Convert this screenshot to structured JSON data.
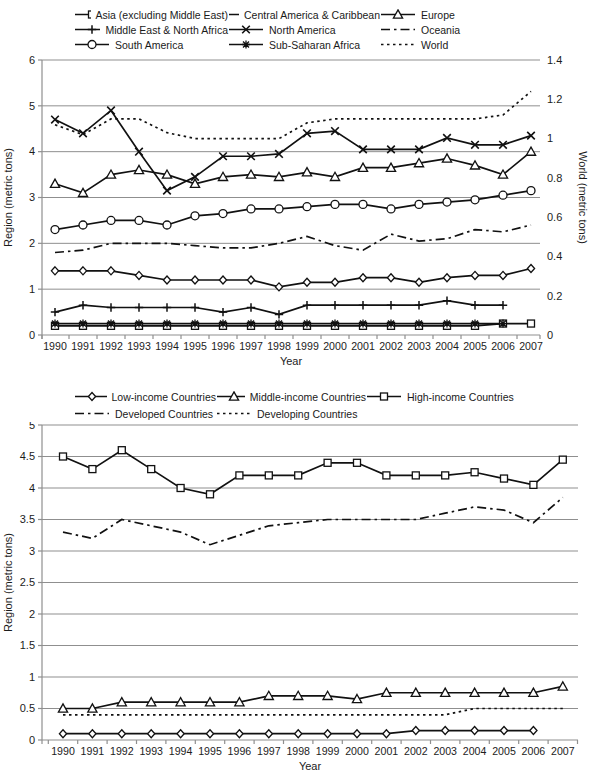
{
  "colors": {
    "ink": "#111111",
    "grid": "#8f8f8f",
    "background": "#ffffff"
  },
  "chart_data": [
    {
      "type": "line",
      "title": "",
      "xlabel": "Year",
      "ylabel": "Region (metric tons)",
      "y2label": "World (metric tons)",
      "x": [
        "1990",
        "1991",
        "1992",
        "1993",
        "1994",
        "1995",
        "1996",
        "1997",
        "1998",
        "1999",
        "2000",
        "2001",
        "2002",
        "2003",
        "2004",
        "2005",
        "2006",
        "2007"
      ],
      "ylim": [
        0,
        6
      ],
      "yticks": [
        "0",
        "1",
        "2",
        "3",
        "4",
        "5",
        "6"
      ],
      "y2lim": [
        0,
        1.4
      ],
      "y2ticks": [
        "0",
        "0.2",
        "0.4",
        "0.6",
        "0.8",
        "1",
        "1.2",
        "1.4"
      ],
      "grid": true,
      "legend_position": "top",
      "series": [
        {
          "name": "Asia (excluding Middle East)",
          "marker": "square",
          "dash": "solid",
          "axis": "left",
          "values": [
            0.2,
            0.2,
            0.2,
            0.2,
            0.2,
            0.2,
            0.2,
            0.2,
            0.2,
            0.2,
            0.2,
            0.2,
            0.2,
            0.2,
            0.2,
            0.2,
            0.25,
            0.25
          ]
        },
        {
          "name": "Central America & Caribbean",
          "marker": "diamond",
          "dash": "solid",
          "axis": "left",
          "values": [
            1.4,
            1.4,
            1.4,
            1.3,
            1.2,
            1.2,
            1.2,
            1.2,
            1.05,
            1.15,
            1.15,
            1.25,
            1.25,
            1.15,
            1.25,
            1.3,
            1.3,
            1.45
          ]
        },
        {
          "name": "Europe",
          "marker": "triangle",
          "dash": "solid",
          "axis": "left",
          "values": [
            3.3,
            3.1,
            3.5,
            3.6,
            3.5,
            3.3,
            3.45,
            3.5,
            3.45,
            3.55,
            3.45,
            3.65,
            3.65,
            3.75,
            3.85,
            3.7,
            3.5,
            4.0
          ]
        },
        {
          "name": "Middle East & North Africa",
          "marker": "plus",
          "dash": "solid",
          "axis": "left",
          "values": [
            0.5,
            0.65,
            0.6,
            0.6,
            0.6,
            0.6,
            0.5,
            0.6,
            0.45,
            0.65,
            0.65,
            0.65,
            0.65,
            0.65,
            0.75,
            0.65,
            0.65,
            null
          ]
        },
        {
          "name": "North America",
          "marker": "x",
          "dash": "solid",
          "axis": "left",
          "values": [
            4.7,
            4.4,
            4.9,
            4.0,
            3.15,
            3.45,
            3.9,
            3.9,
            3.95,
            4.4,
            4.45,
            4.05,
            4.05,
            4.05,
            4.3,
            4.15,
            4.15,
            4.35
          ]
        },
        {
          "name": "Oceania",
          "marker": "none",
          "dash": "dashdot",
          "axis": "left",
          "values": [
            1.8,
            1.85,
            2.0,
            2.0,
            2.0,
            1.95,
            1.9,
            1.9,
            2.0,
            2.15,
            1.95,
            1.85,
            2.2,
            2.05,
            2.1,
            2.3,
            2.25,
            2.4
          ]
        },
        {
          "name": "South America",
          "marker": "circle",
          "dash": "solid",
          "axis": "left",
          "values": [
            2.3,
            2.4,
            2.5,
            2.5,
            2.4,
            2.6,
            2.65,
            2.75,
            2.75,
            2.8,
            2.85,
            2.85,
            2.75,
            2.85,
            2.9,
            2.95,
            3.05,
            3.15
          ]
        },
        {
          "name": "Sub-Saharan Africa",
          "marker": "star",
          "dash": "solid",
          "axis": "left",
          "values": [
            0.25,
            0.25,
            0.25,
            0.25,
            0.25,
            0.25,
            0.25,
            0.25,
            0.25,
            0.25,
            0.25,
            0.25,
            0.25,
            0.25,
            0.25,
            0.25,
            0.25,
            null
          ]
        },
        {
          "name": "World",
          "marker": "none",
          "dash": "dotted",
          "axis": "right",
          "values": [
            1.07,
            1.02,
            1.1,
            1.1,
            1.03,
            1.0,
            1.0,
            1.0,
            1.0,
            1.08,
            1.1,
            1.1,
            1.1,
            1.1,
            1.1,
            1.1,
            1.12,
            1.24
          ]
        }
      ]
    },
    {
      "type": "line",
      "title": "",
      "xlabel": "Year",
      "ylabel": "Region (metric tons)",
      "x": [
        "1990",
        "1991",
        "1992",
        "1993",
        "1994",
        "1995",
        "1996",
        "1997",
        "1998",
        "1999",
        "2000",
        "2001",
        "2002",
        "2003",
        "2004",
        "2005",
        "2006",
        "2007"
      ],
      "ylim": [
        0,
        5
      ],
      "yticks": [
        "0",
        "0.5",
        "1",
        "1.5",
        "2",
        "2.5",
        "3",
        "3.5",
        "4",
        "4.5",
        "5"
      ],
      "grid": true,
      "legend_position": "top",
      "series": [
        {
          "name": "Low-income Countries",
          "marker": "diamond",
          "dash": "solid",
          "axis": "left",
          "values": [
            0.1,
            0.1,
            0.1,
            0.1,
            0.1,
            0.1,
            0.1,
            0.1,
            0.1,
            0.1,
            0.1,
            0.1,
            0.15,
            0.15,
            0.15,
            0.15,
            0.15,
            null
          ]
        },
        {
          "name": "Middle-income Countries",
          "marker": "triangle",
          "dash": "solid",
          "axis": "left",
          "values": [
            0.5,
            0.5,
            0.6,
            0.6,
            0.6,
            0.6,
            0.6,
            0.7,
            0.7,
            0.7,
            0.65,
            0.75,
            0.75,
            0.75,
            0.75,
            0.75,
            0.75,
            0.85
          ]
        },
        {
          "name": "High-income Countries",
          "marker": "square",
          "dash": "solid",
          "axis": "left",
          "values": [
            4.5,
            4.3,
            4.6,
            4.3,
            4.0,
            3.9,
            4.2,
            4.2,
            4.2,
            4.4,
            4.4,
            4.2,
            4.2,
            4.2,
            4.25,
            4.15,
            4.05,
            4.45
          ]
        },
        {
          "name": "Developed Countries",
          "marker": "none",
          "dash": "dashdot",
          "axis": "left",
          "values": [
            3.3,
            3.2,
            3.5,
            3.4,
            3.3,
            3.1,
            3.25,
            3.4,
            3.45,
            3.5,
            3.5,
            3.5,
            3.5,
            3.6,
            3.7,
            3.65,
            3.45,
            3.85
          ]
        },
        {
          "name": "Developing Countries",
          "marker": "none",
          "dash": "dotted",
          "axis": "left",
          "values": [
            0.4,
            0.4,
            0.4,
            0.4,
            0.4,
            0.4,
            0.4,
            0.4,
            0.4,
            0.4,
            0.4,
            0.4,
            0.4,
            0.4,
            0.5,
            0.5,
            0.5,
            0.5
          ]
        }
      ]
    }
  ]
}
